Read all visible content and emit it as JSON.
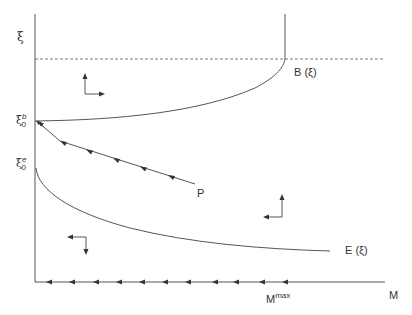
{
  "diagram": {
    "type": "phase-diagram",
    "colors": {
      "line": "#555555",
      "text": "#333333",
      "background": "#ffffff"
    },
    "axes": {
      "y_label": "ξ",
      "x_label": "M",
      "y_ticks": [
        {
          "base": "ξ",
          "sub": "0",
          "sup": "b"
        },
        {
          "base": "ξ",
          "sub": "0",
          "sup": "e"
        }
      ],
      "x_ticks": [
        {
          "base": "M",
          "sup": "max"
        }
      ]
    },
    "curves": [
      {
        "id": "B",
        "label": "B (ξ)"
      },
      {
        "id": "E",
        "label": "E (ξ)"
      }
    ],
    "trajectory": {
      "label": "P"
    },
    "reference_line": {
      "style": "dashed"
    },
    "vector_field_arrows": [
      {
        "region": "upper-left",
        "directions": [
          "up",
          "right"
        ]
      },
      {
        "region": "lower-right",
        "directions": [
          "up",
          "left"
        ]
      },
      {
        "region": "lower-left",
        "directions": [
          "left",
          "down"
        ]
      }
    ]
  }
}
